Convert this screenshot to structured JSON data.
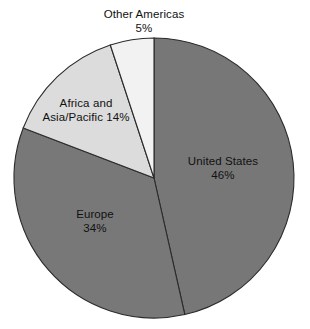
{
  "chart_data": {
    "type": "pie",
    "title": "",
    "categories": [
      "United States",
      "Europe",
      "Africa and Asia/Pacific",
      "Other Americas"
    ],
    "values": [
      46,
      34,
      14,
      5
    ],
    "units": "percent",
    "start_angle_deg": 0,
    "direction": "clockwise",
    "legend": "none",
    "grid": false,
    "slices": [
      {
        "name": "United States",
        "label_line1": "United States",
        "label_line2": "46%",
        "value": 46,
        "color": "#777777",
        "label_position": "inside"
      },
      {
        "name": "Europe",
        "label_line1": "Europe",
        "label_line2": "34%",
        "value": 34,
        "color": "#787878",
        "label_position": "inside"
      },
      {
        "name": "Africa and Asia/Pacific",
        "label_line1": "Africa and",
        "label_line2": "Asia/Pacific 14%",
        "value": 14,
        "color": "#dcdcdc",
        "label_position": "inside"
      },
      {
        "name": "Other Americas",
        "label_line1": "Other Americas",
        "label_line2": "5%",
        "value": 5,
        "color": "#f2f2f2",
        "label_position": "outside-top"
      }
    ],
    "colors": {
      "background": "#ffffff",
      "outline": "#2b2b2b",
      "text": "#111111"
    },
    "geometry": {
      "center_x": 154,
      "center_y": 178,
      "radius": 140
    }
  }
}
